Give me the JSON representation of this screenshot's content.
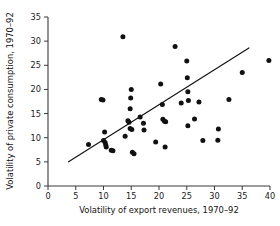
{
  "chart_data": {
    "type": "scatter",
    "title": "",
    "xlabel": "Volatility of export revenues, 1970–92",
    "ylabel": "Volatility of private consumption, 1970–92",
    "xlim": [
      0,
      40
    ],
    "ylim": [
      0,
      35
    ],
    "xticks": [
      0,
      5,
      10,
      15,
      20,
      25,
      30,
      35,
      40
    ],
    "yticks": [
      0,
      5,
      10,
      15,
      20,
      25,
      30,
      35
    ],
    "xticklabels": [
      "0",
      "5",
      "10",
      "15",
      "20",
      "25",
      "30",
      "35",
      "40"
    ],
    "yticklabels": [
      "0",
      "5",
      "10",
      "15",
      "20",
      "25",
      "30",
      "35"
    ],
    "grid": false,
    "legend": null,
    "marker": "filled-circle",
    "marker_color": "#111111",
    "points": [
      {
        "x": 7.3,
        "y": 8.6
      },
      {
        "x": 9.6,
        "y": 17.9
      },
      {
        "x": 9.9,
        "y": 17.8
      },
      {
        "x": 10.2,
        "y": 11.2
      },
      {
        "x": 10.0,
        "y": 9.4
      },
      {
        "x": 10.3,
        "y": 9.0
      },
      {
        "x": 10.4,
        "y": 8.5
      },
      {
        "x": 10.5,
        "y": 8.1
      },
      {
        "x": 11.4,
        "y": 7.4
      },
      {
        "x": 11.7,
        "y": 7.3
      },
      {
        "x": 13.5,
        "y": 30.9
      },
      {
        "x": 13.9,
        "y": 10.3
      },
      {
        "x": 14.4,
        "y": 13.5
      },
      {
        "x": 14.6,
        "y": 13.2
      },
      {
        "x": 14.8,
        "y": 11.9
      },
      {
        "x": 15.0,
        "y": 20.0
      },
      {
        "x": 14.9,
        "y": 18.2
      },
      {
        "x": 14.8,
        "y": 16.0
      },
      {
        "x": 15.1,
        "y": 11.7
      },
      {
        "x": 15.2,
        "y": 7.0
      },
      {
        "x": 15.5,
        "y": 6.7
      },
      {
        "x": 16.6,
        "y": 14.3
      },
      {
        "x": 17.2,
        "y": 13.0
      },
      {
        "x": 17.3,
        "y": 11.6
      },
      {
        "x": 19.4,
        "y": 9.1
      },
      {
        "x": 20.3,
        "y": 21.1
      },
      {
        "x": 20.6,
        "y": 16.9
      },
      {
        "x": 20.7,
        "y": 13.8
      },
      {
        "x": 21.0,
        "y": 13.4
      },
      {
        "x": 21.2,
        "y": 13.3
      },
      {
        "x": 21.1,
        "y": 8.1
      },
      {
        "x": 22.9,
        "y": 28.9
      },
      {
        "x": 24.0,
        "y": 17.2
      },
      {
        "x": 25.0,
        "y": 25.9
      },
      {
        "x": 25.1,
        "y": 22.4
      },
      {
        "x": 25.2,
        "y": 19.5
      },
      {
        "x": 25.3,
        "y": 17.7
      },
      {
        "x": 25.2,
        "y": 12.5
      },
      {
        "x": 26.4,
        "y": 13.9
      },
      {
        "x": 27.2,
        "y": 17.4
      },
      {
        "x": 27.9,
        "y": 9.4
      },
      {
        "x": 30.6,
        "y": 9.5
      },
      {
        "x": 30.7,
        "y": 11.8
      },
      {
        "x": 32.6,
        "y": 17.9
      },
      {
        "x": 35.0,
        "y": 23.5
      },
      {
        "x": 39.8,
        "y": 26.0
      }
    ],
    "trendline": {
      "type": "linear-fit",
      "x_start": 3.7,
      "y_start": 5.0,
      "x_end": 36.2,
      "y_end": 28.6,
      "color": "#111111"
    }
  }
}
